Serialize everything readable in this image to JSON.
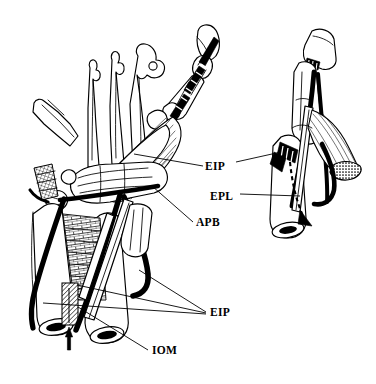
{
  "figure": {
    "kind": "anatomical-line-drawing",
    "background_color": "#ffffff",
    "ink_color": "#000000",
    "width": 376,
    "height": 384,
    "views": [
      {
        "name": "main-view",
        "description": "Dorsal view of hand, wrist and distal forearm"
      },
      {
        "name": "inset-view",
        "description": "Lateral detail view of thumb and first metacarpal"
      }
    ]
  },
  "labels": [
    {
      "id": "eip-upper",
      "text": "EIP",
      "x": 205,
      "y": 170,
      "anchor": "start",
      "meaning": "extensor indicis proprius",
      "leaders": 2
    },
    {
      "id": "epl",
      "text": "EPL",
      "x": 210,
      "y": 200,
      "anchor": "start",
      "meaning": "extensor pollicis longus",
      "leaders": 1
    },
    {
      "id": "apb",
      "text": "APB",
      "x": 196,
      "y": 226,
      "anchor": "start",
      "meaning": "abductor pollicis brevis",
      "leaders": 1
    },
    {
      "id": "eip-lower",
      "text": "EIP",
      "x": 210,
      "y": 316,
      "anchor": "start",
      "meaning": "extensor indicis proprius",
      "leaders": 3
    },
    {
      "id": "iom",
      "text": "IOM",
      "x": 152,
      "y": 354,
      "anchor": "start",
      "meaning": "interosseous membrane",
      "leaders": 1
    }
  ],
  "annotations": {
    "arrow_direction": "downward",
    "dashed_line_present": true,
    "cut_bone_ends": 3,
    "hatched_regions": [
      "interosseous-membrane",
      "wrist-retinaculum",
      "cut-muscle-end"
    ]
  }
}
